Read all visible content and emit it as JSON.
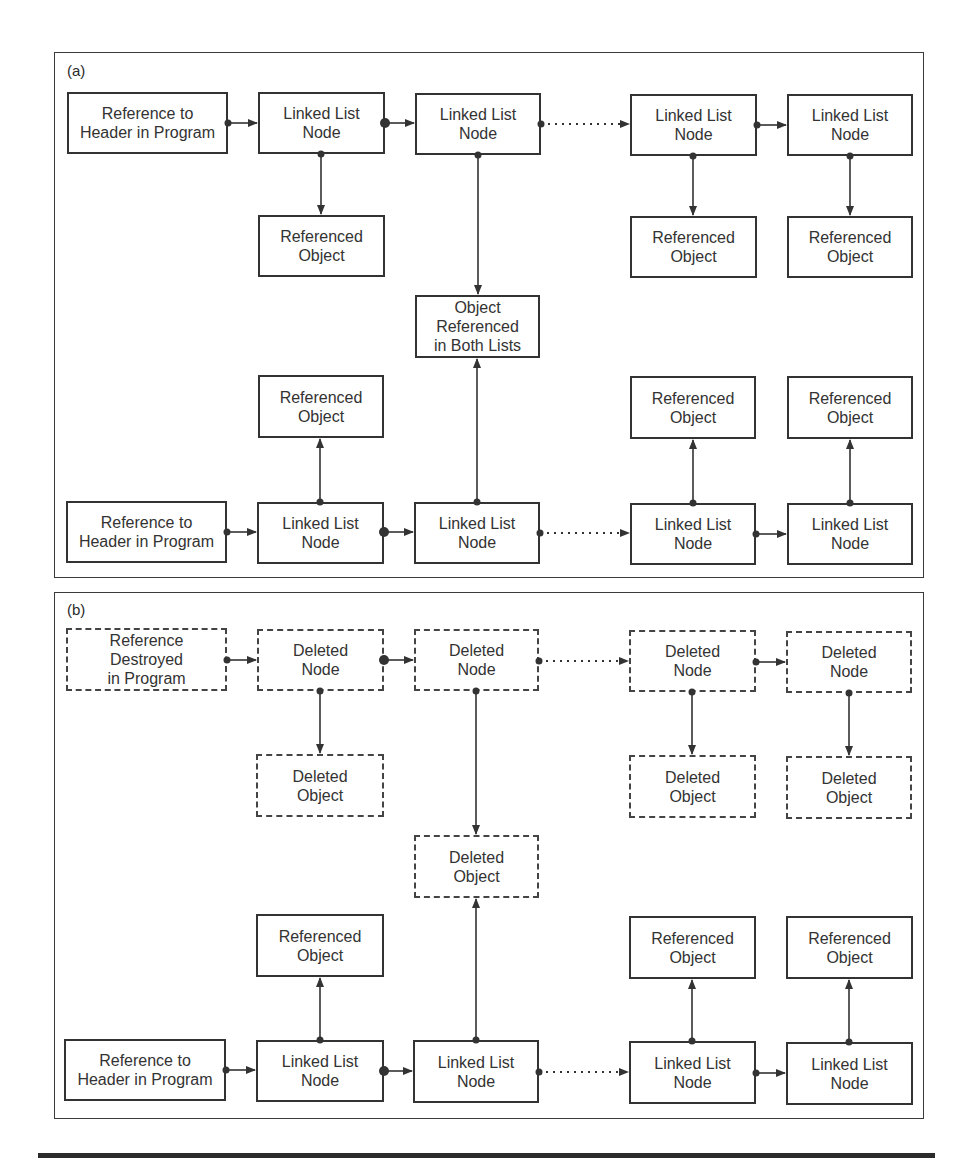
{
  "figure": {
    "panels": [
      {
        "label": "(a)",
        "header": "Reference to\nHeader in Program",
        "top_row": [
          "Linked List\nNode",
          "Linked List\nNode",
          "Linked List\nNode",
          "Linked List\nNode"
        ],
        "top_objects": [
          "Referenced\nObject",
          "Referenced\nObject",
          "Referenced\nObject"
        ],
        "shared_object": "Object\nReferenced\nin Both Lists",
        "bottom_objects": [
          "Referenced\nObject",
          "Referenced\nObject",
          "Referenced\nObject"
        ],
        "bottom_header": "Reference to\nHeader in Program",
        "bottom_row": [
          "Linked List\nNode",
          "Linked List\nNode",
          "Linked List\nNode",
          "Linked List\nNode"
        ]
      },
      {
        "label": "(b)",
        "header": "Reference\nDestroyed\nin Program",
        "top_row": [
          "Deleted\nNode",
          "Deleted\nNode",
          "Deleted\nNode",
          "Deleted\nNode"
        ],
        "top_objects": [
          "Deleted\nObject",
          "Deleted\nObject",
          "Deleted\nObject"
        ],
        "shared_object": "Deleted\nObject",
        "bottom_objects": [
          "Referenced\nObject",
          "Referenced\nObject",
          "Referenced\nObject"
        ],
        "bottom_header": "Reference to\nHeader in Program",
        "bottom_row": [
          "Linked List\nNode",
          "Linked List\nNode",
          "Linked List\nNode",
          "Linked List\nNode"
        ]
      }
    ],
    "colors": {
      "line": "#333333",
      "background": "#ffffff"
    }
  }
}
